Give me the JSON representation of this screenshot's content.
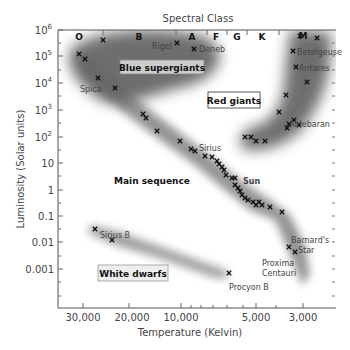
{
  "chart_data": {
    "type": "scatter",
    "title": "Spectral Class",
    "xlabel": "Temperature (Kelvin)",
    "ylabel": "Luminosity (Solar units)",
    "x_scale": "log, reversed",
    "y_scale": "log",
    "xlim": [
      40000,
      2300
    ],
    "ylim": [
      0.0001,
      1000000
    ],
    "grid": false,
    "x_ticks": [
      {
        "label": "30,000",
        "value": 30000
      },
      {
        "label": "20,000",
        "value": 20000
      },
      {
        "label": "10,000",
        "value": 10000
      },
      {
        "label": "5,000",
        "value": 5000
      },
      {
        "label": "3,000",
        "value": 3000
      }
    ],
    "y_ticks": [
      {
        "label": "10⁶",
        "value": 1000000
      },
      {
        "label": "10⁵",
        "value": 100000
      },
      {
        "label": "10⁴",
        "value": 10000
      },
      {
        "label": "10³",
        "value": 1000
      },
      {
        "label": "10²",
        "value": 100
      },
      {
        "label": "10",
        "value": 10
      },
      {
        "label": "1",
        "value": 1
      },
      {
        "label": "0.1",
        "value": 0.1
      },
      {
        "label": "0.01",
        "value": 0.01
      },
      {
        "label": "0.001",
        "value": 0.001
      }
    ],
    "spectral_classes": [
      {
        "label": "O",
        "px": 79
      },
      {
        "label": "B",
        "px": 138
      },
      {
        "label": "A",
        "px": 191
      },
      {
        "label": "F",
        "px": 216
      },
      {
        "label": "G",
        "px": 237
      },
      {
        "label": "K",
        "px": 262
      },
      {
        "label": "M",
        "px": 302
      }
    ],
    "regions": [
      {
        "name": "Blue supergiants",
        "label": "Blue supergiants"
      },
      {
        "name": "Red giants",
        "label": "Red giants"
      },
      {
        "name": "Main sequence",
        "label": "Main sequence"
      },
      {
        "name": "White dwarfs",
        "label": "White dwarfs"
      }
    ],
    "named_stars": [
      {
        "name": "Rigel",
        "temp": 11000,
        "lum": 250000
      },
      {
        "name": "Deneb",
        "temp": 8500,
        "lum": 170000
      },
      {
        "name": "Betelgeuse",
        "temp": 3500,
        "lum": 130000
      },
      {
        "name": "Antares",
        "temp": 3400,
        "lum": 35000
      },
      {
        "name": "Spica",
        "temp": 25000,
        "lum": 13000
      },
      {
        "name": "Aldebaran",
        "temp": 4000,
        "lum": 300
      },
      {
        "name": "Sirius",
        "temp": 9900,
        "lum": 25
      },
      {
        "name": "Sun",
        "temp": 5800,
        "lum": 1
      },
      {
        "name": "Sirius B",
        "temp": 25000,
        "lum": 0.03
      },
      {
        "name": "Procyon B",
        "temp": 7700,
        "lum": 0.0006
      },
      {
        "name": "Barnard's Star",
        "temp": 3200,
        "lum": 0.0004
      },
      {
        "name": "Proxima Centauri",
        "temp": 3000,
        "lum": 0.00017
      }
    ],
    "points_px": [
      [
        79,
        54
      ],
      [
        85,
        59
      ],
      [
        103,
        40
      ],
      [
        98,
        78
      ],
      [
        115,
        88
      ],
      [
        177,
        43
      ],
      [
        194,
        49
      ],
      [
        300,
        36
      ],
      [
        317,
        38
      ],
      [
        293,
        51
      ],
      [
        296,
        67
      ],
      [
        307,
        82
      ],
      [
        286,
        95
      ],
      [
        279,
        112
      ],
      [
        289,
        124
      ],
      [
        294,
        120
      ],
      [
        287,
        128
      ],
      [
        299,
        125
      ],
      [
        245,
        137
      ],
      [
        251,
        137
      ],
      [
        256,
        141
      ],
      [
        265,
        141
      ],
      [
        143,
        114
      ],
      [
        146,
        118
      ],
      [
        157,
        131
      ],
      [
        180,
        141
      ],
      [
        191,
        149
      ],
      [
        195,
        151
      ],
      [
        205,
        156
      ],
      [
        212,
        157
      ],
      [
        217,
        161
      ],
      [
        219,
        164
      ],
      [
        222,
        167
      ],
      [
        224,
        170
      ],
      [
        226,
        175
      ],
      [
        232,
        178
      ],
      [
        235,
        178
      ],
      [
        235,
        185
      ],
      [
        238,
        188
      ],
      [
        240,
        191
      ],
      [
        242,
        195
      ],
      [
        245,
        198
      ],
      [
        248,
        200
      ],
      [
        253,
        202
      ],
      [
        256,
        205
      ],
      [
        259,
        202
      ],
      [
        262,
        205
      ],
      [
        270,
        207
      ],
      [
        282,
        212
      ],
      [
        289,
        247
      ],
      [
        295,
        252
      ],
      [
        95,
        229
      ],
      [
        112,
        240
      ],
      [
        229,
        273
      ]
    ]
  },
  "labels": {
    "title": "Spectral Class",
    "xlabel": "Temperature (Kelvin)",
    "ylabel": "Luminosity (Solar units)",
    "rigel": "Rigel",
    "deneb": "Deneb",
    "betelgeuse": "Betelgeuse",
    "antares": "Antares",
    "spica": "Spica",
    "aldebaran": "Aldebaran",
    "sirius": "Sirius",
    "sun": "Sun",
    "sirius_b": "Sirius B",
    "procyon_b": "Procyon B",
    "barnard1": "Barnard's",
    "barnard2": "Star",
    "proxima1": "Proxima",
    "proxima2": "Centauri",
    "blue_supergiants": "Blue supergiants",
    "red_giants": "Red giants",
    "main_sequence": "Main sequence",
    "white_dwarfs": "White dwarfs",
    "y": [
      "10",
      "10",
      "10",
      "10",
      "10",
      "10",
      "1",
      "0.1",
      "0.01",
      "0.001"
    ],
    "y_exp": [
      "6",
      "5",
      "4",
      "3",
      "2"
    ],
    "x": [
      "30,000",
      "20,000",
      "10,000",
      "5,000",
      "3,000"
    ],
    "cls": [
      "O",
      "B",
      "A",
      "F",
      "G",
      "K",
      "M"
    ]
  }
}
